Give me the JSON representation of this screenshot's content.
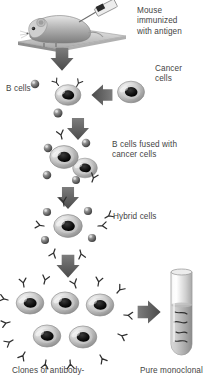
{
  "figure": {
    "background_color": "#ffffff",
    "text_color": "#444444",
    "style": "grayscale scientific illustration"
  },
  "labels": {
    "mouse": "Mouse\nimmunized\nwith antigen",
    "cancer_cells": "Cancer\ncells",
    "b_cells": "B cells",
    "fused": "B cells fused with\ncancer cells",
    "hybrid": "Hybrid cells",
    "clones": "Clones of antibody-",
    "pure": "Pure monoclonal"
  },
  "elements": {
    "mouse_icon": "mouse-with-syringe",
    "syringe_icon": "syringe-icon",
    "platform_icon": "platform-icon",
    "b_cell_icon": "b-cell-icon",
    "cancer_cell_icon": "cancer-cell-icon",
    "fused_cell_icon": "fused-cell-icon",
    "hybrid_cell_icon": "hybrid-cell-icon",
    "clone_cell_icon": "clone-cell-icon",
    "antibody_icon": "y-shaped-antibody-icon",
    "test_tube_icon": "test-tube-icon",
    "arrow_down_icon": "arrow-down-icon",
    "arrow_left_icon": "arrow-left-icon",
    "arrow_right_icon": "arrow-right-icon"
  },
  "counts": {
    "clone_cells": 5,
    "fused_cells": 2,
    "down_arrows": 4
  },
  "colors": {
    "cell_outer": "#b9b9b9",
    "cell_highlight": "#efefef",
    "nucleus": "#1f1f1f",
    "arrow": "#5a5a5a",
    "antibody": "#333333",
    "sphere": "#6a6a6a",
    "tube_glass": "#d8d8d8",
    "tube_liquid": "#9a9a9a"
  }
}
